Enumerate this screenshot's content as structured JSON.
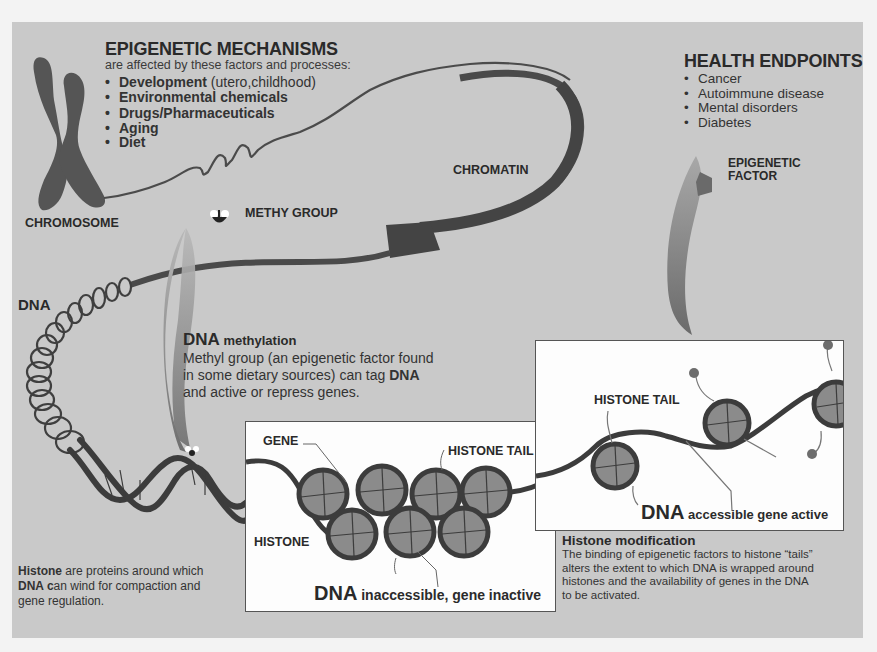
{
  "epigenetic_mechanisms": {
    "title": "EPIGENETIC MECHANISMS",
    "subtitle": "are affected by these factors and processes:",
    "items": [
      {
        "bold": "Development",
        "rest": " (utero,childhood)"
      },
      {
        "bold": "Environmental chemicals",
        "rest": ""
      },
      {
        "bold": "Drugs/Pharmaceuticals",
        "rest": ""
      },
      {
        "bold": "Aging",
        "rest": ""
      },
      {
        "bold": "Diet",
        "rest": ""
      }
    ]
  },
  "health_endpoints": {
    "title": "HEALTH ENDPOINTS",
    "items": [
      "Cancer",
      "Autoimmune disease",
      "Mental disorders",
      "Diabetes"
    ]
  },
  "labels": {
    "chromosome": "CHROMOSOME",
    "chromatin": "CHROMATIN",
    "methy_group": "METHY GROUP",
    "epigenetic_factor_line1": "EPIGENETIC",
    "epigenetic_factor_line2": "FACTOR",
    "dna": "DNA",
    "gene": "GENE",
    "histone": "HISTONE",
    "histone_tail_left": "HISTONE TAIL",
    "histone_tail_right": "HISTONE TAIL"
  },
  "dna_methylation": {
    "heading_bold": "DNA",
    "heading_rest": " methylation",
    "line1": "Methyl group (an epigenetic factor found",
    "line2_pre": "in some  dietary sources) can tag ",
    "line2_bold": "DNA",
    "line3": "and active or repress genes."
  },
  "inactive_box": {
    "caption_bold": "DNA",
    "caption_rest": " inaccessible, gene inactive"
  },
  "active_box": {
    "caption_bold": "DNA",
    "caption_rest": " accessible gene active"
  },
  "histone_note": {
    "bold1": "Histone",
    "text1": " are proteins around which",
    "bold2": "DNA c",
    "text2": "an wind for compaction and",
    "text3": "gene regulation."
  },
  "histone_modification": {
    "title": "Histone modification",
    "lines": [
      "The binding of epigenetic factors to histone “tails”",
      "alters the extent to which DNA is wrapped around",
      "histones and the availability of genes in the DNA",
      "to be activated."
    ]
  },
  "colors": {
    "panel": "#c9c9c9",
    "dark_strand": "#4a4a4a",
    "histone_fill": "#8a8a8a",
    "box_fill": "#fdfdfd"
  }
}
